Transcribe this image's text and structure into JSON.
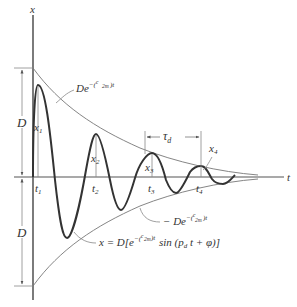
{
  "figure": {
    "axes": {
      "vertical_label": "x",
      "horizontal_label": "t"
    },
    "amplitude_labels": {
      "upper_D": "D",
      "lower_D": "D"
    },
    "peak_labels": [
      "x",
      "x",
      "x",
      "x"
    ],
    "peak_subscripts": [
      "1",
      "2",
      "3",
      "4"
    ],
    "time_labels": [
      "t",
      "t",
      "t",
      "t"
    ],
    "time_subscripts": [
      "1",
      "2",
      "3",
      "4"
    ],
    "period": {
      "symbol": "τ",
      "subscript": "d"
    },
    "upper_envelope": {
      "prefix": "De",
      "exp_sign": "−(",
      "frac_num": "c",
      "frac_den": "2m",
      "exp_suffix": ")t"
    },
    "lower_envelope": {
      "prefix": "− De",
      "exp_sign": "−(",
      "frac_num": "c",
      "frac_den": "2m",
      "exp_suffix": ")t"
    },
    "response_equation": {
      "lhs": "x = D[e",
      "exp_sign": "−(",
      "frac_num": "c",
      "frac_den": "2m",
      "exp_suffix": ")t",
      "rest": "sin (p",
      "rest_sub": "d",
      "rest_tail": " t + φ)]"
    },
    "colors": {
      "curve": "#333333",
      "envelope": "#777777",
      "axes": "#444444",
      "dimension": "#888888"
    }
  }
}
